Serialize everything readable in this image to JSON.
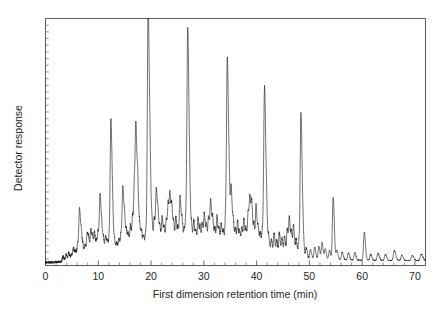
{
  "figure": {
    "background_color": "#ffffff",
    "trace_color": "#1a1a1a",
    "axis_color": "#4a4a4a"
  },
  "chart_data": {
    "type": "line",
    "title": "",
    "subtitle": "",
    "xlabel": "First dimension retention time (min)",
    "ylabel": "Detector response",
    "xlim": [
      0,
      72
    ],
    "ylim": [
      0,
      100
    ],
    "xticks": [
      0,
      10,
      20,
      30,
      40,
      50,
      60,
      70
    ],
    "xtick_labels": [
      "0",
      "10",
      "20",
      "30",
      "40",
      "50",
      "60",
      "70"
    ],
    "yticks": [],
    "ytick_labels": [],
    "y_minor_tick_count": 37,
    "x_minor_tick_step": 2,
    "grid": false,
    "legend": false,
    "legend_position": "none",
    "annotations": [],
    "series": [
      {
        "name": "GC x GC first dimension chromatogram",
        "baseline": 2.0,
        "baseline_drift": [
          {
            "x": 0,
            "y": 1.2
          },
          {
            "x": 3,
            "y": 1.5
          },
          {
            "x": 8,
            "y": 3.2
          },
          {
            "x": 14,
            "y": 4.6
          },
          {
            "x": 20,
            "y": 5.4
          },
          {
            "x": 28,
            "y": 5.6
          },
          {
            "x": 36,
            "y": 5.2
          },
          {
            "x": 44,
            "y": 4.2
          },
          {
            "x": 50,
            "y": 3.0
          },
          {
            "x": 58,
            "y": 2.2
          },
          {
            "x": 66,
            "y": 2.0
          },
          {
            "x": 72,
            "y": 2.1
          }
        ],
        "peaks": [
          {
            "x": 3.3,
            "h": 2.0,
            "w": 0.14
          },
          {
            "x": 3.9,
            "h": 2.6,
            "w": 0.12
          },
          {
            "x": 4.4,
            "h": 3.2,
            "w": 0.12
          },
          {
            "x": 4.9,
            "h": 2.4,
            "w": 0.12
          },
          {
            "x": 5.3,
            "h": 4.5,
            "w": 0.13
          },
          {
            "x": 5.7,
            "h": 3.0,
            "w": 0.12
          },
          {
            "x": 6.1,
            "h": 6.0,
            "w": 0.12
          },
          {
            "x": 6.45,
            "h": 19.5,
            "w": 0.13
          },
          {
            "x": 6.8,
            "h": 7.5,
            "w": 0.12
          },
          {
            "x": 7.1,
            "h": 4.0,
            "w": 0.12
          },
          {
            "x": 7.5,
            "h": 5.2,
            "w": 0.12
          },
          {
            "x": 7.9,
            "h": 9.5,
            "w": 0.12
          },
          {
            "x": 8.2,
            "h": 6.0,
            "w": 0.12
          },
          {
            "x": 8.6,
            "h": 11.0,
            "w": 0.12
          },
          {
            "x": 8.95,
            "h": 7.0,
            "w": 0.12
          },
          {
            "x": 9.3,
            "h": 9.0,
            "w": 0.12
          },
          {
            "x": 9.7,
            "h": 6.0,
            "w": 0.12
          },
          {
            "x": 10.0,
            "h": 8.5,
            "w": 0.12
          },
          {
            "x": 10.35,
            "h": 24.0,
            "w": 0.13
          },
          {
            "x": 10.7,
            "h": 8.0,
            "w": 0.12
          },
          {
            "x": 11.0,
            "h": 5.5,
            "w": 0.12
          },
          {
            "x": 11.4,
            "h": 7.5,
            "w": 0.12
          },
          {
            "x": 11.75,
            "h": 5.0,
            "w": 0.12
          },
          {
            "x": 12.1,
            "h": 6.5,
            "w": 0.12
          },
          {
            "x": 12.4,
            "h": 53.0,
            "w": 0.14
          },
          {
            "x": 12.75,
            "h": 9.0,
            "w": 0.12
          },
          {
            "x": 13.1,
            "h": 5.0,
            "w": 0.12
          },
          {
            "x": 13.5,
            "h": 4.5,
            "w": 0.12
          },
          {
            "x": 13.9,
            "h": 6.0,
            "w": 0.12
          },
          {
            "x": 14.3,
            "h": 8.0,
            "w": 0.12
          },
          {
            "x": 14.65,
            "h": 26.0,
            "w": 0.13
          },
          {
            "x": 15.0,
            "h": 11.5,
            "w": 0.12
          },
          {
            "x": 15.35,
            "h": 8.0,
            "w": 0.12
          },
          {
            "x": 15.7,
            "h": 7.0,
            "w": 0.12
          },
          {
            "x": 16.1,
            "h": 11.0,
            "w": 0.12
          },
          {
            "x": 16.5,
            "h": 14.0,
            "w": 0.12
          },
          {
            "x": 16.85,
            "h": 25.0,
            "w": 0.13
          },
          {
            "x": 17.15,
            "h": 44.5,
            "w": 0.14
          },
          {
            "x": 17.5,
            "h": 20.0,
            "w": 0.12
          },
          {
            "x": 17.85,
            "h": 9.0,
            "w": 0.12
          },
          {
            "x": 18.2,
            "h": 8.0,
            "w": 0.12
          },
          {
            "x": 18.6,
            "h": 6.5,
            "w": 0.12
          },
          {
            "x": 19.0,
            "h": 7.5,
            "w": 0.12
          },
          {
            "x": 19.45,
            "h": 99.8,
            "w": 0.15
          },
          {
            "x": 19.85,
            "h": 22.0,
            "w": 0.12
          },
          {
            "x": 20.2,
            "h": 10.0,
            "w": 0.12
          },
          {
            "x": 20.6,
            "h": 13.0,
            "w": 0.12
          },
          {
            "x": 21.0,
            "h": 24.5,
            "w": 0.13
          },
          {
            "x": 21.35,
            "h": 12.0,
            "w": 0.12
          },
          {
            "x": 21.7,
            "h": 9.0,
            "w": 0.12
          },
          {
            "x": 22.1,
            "h": 14.0,
            "w": 0.12
          },
          {
            "x": 22.5,
            "h": 9.5,
            "w": 0.12
          },
          {
            "x": 22.9,
            "h": 12.5,
            "w": 0.12
          },
          {
            "x": 23.25,
            "h": 18.0,
            "w": 0.12
          },
          {
            "x": 23.6,
            "h": 21.0,
            "w": 0.13
          },
          {
            "x": 23.95,
            "h": 15.0,
            "w": 0.12
          },
          {
            "x": 24.3,
            "h": 10.0,
            "w": 0.12
          },
          {
            "x": 24.7,
            "h": 13.5,
            "w": 0.12
          },
          {
            "x": 25.1,
            "h": 9.0,
            "w": 0.12
          },
          {
            "x": 25.5,
            "h": 22.0,
            "w": 0.13
          },
          {
            "x": 25.9,
            "h": 11.0,
            "w": 0.12
          },
          {
            "x": 26.3,
            "h": 8.5,
            "w": 0.12
          },
          {
            "x": 26.6,
            "h": 10.0,
            "w": 0.12
          },
          {
            "x": 26.95,
            "h": 89.0,
            "w": 0.15
          },
          {
            "x": 27.35,
            "h": 14.0,
            "w": 0.12
          },
          {
            "x": 27.7,
            "h": 9.0,
            "w": 0.12
          },
          {
            "x": 28.1,
            "h": 12.0,
            "w": 0.12
          },
          {
            "x": 28.5,
            "h": 8.0,
            "w": 0.12
          },
          {
            "x": 28.9,
            "h": 13.0,
            "w": 0.12
          },
          {
            "x": 29.3,
            "h": 9.5,
            "w": 0.12
          },
          {
            "x": 29.7,
            "h": 11.0,
            "w": 0.12
          },
          {
            "x": 30.1,
            "h": 15.0,
            "w": 0.12
          },
          {
            "x": 30.5,
            "h": 10.0,
            "w": 0.12
          },
          {
            "x": 30.9,
            "h": 13.5,
            "w": 0.12
          },
          {
            "x": 31.3,
            "h": 20.0,
            "w": 0.13
          },
          {
            "x": 31.7,
            "h": 12.0,
            "w": 0.12
          },
          {
            "x": 32.1,
            "h": 9.0,
            "w": 0.12
          },
          {
            "x": 32.5,
            "h": 14.0,
            "w": 0.12
          },
          {
            "x": 32.9,
            "h": 8.5,
            "w": 0.12
          },
          {
            "x": 33.3,
            "h": 11.0,
            "w": 0.12
          },
          {
            "x": 33.7,
            "h": 8.0,
            "w": 0.12
          },
          {
            "x": 34.1,
            "h": 12.0,
            "w": 0.12
          },
          {
            "x": 34.45,
            "h": 77.0,
            "w": 0.15
          },
          {
            "x": 34.85,
            "h": 16.0,
            "w": 0.12
          },
          {
            "x": 35.2,
            "h": 24.0,
            "w": 0.13
          },
          {
            "x": 35.6,
            "h": 11.0,
            "w": 0.12
          },
          {
            "x": 36.0,
            "h": 9.0,
            "w": 0.12
          },
          {
            "x": 36.4,
            "h": 12.0,
            "w": 0.12
          },
          {
            "x": 36.8,
            "h": 8.0,
            "w": 0.12
          },
          {
            "x": 37.2,
            "h": 10.0,
            "w": 0.12
          },
          {
            "x": 37.6,
            "h": 13.0,
            "w": 0.12
          },
          {
            "x": 38.0,
            "h": 9.5,
            "w": 0.12
          },
          {
            "x": 38.4,
            "h": 16.0,
            "w": 0.12
          },
          {
            "x": 38.75,
            "h": 21.0,
            "w": 0.13
          },
          {
            "x": 39.1,
            "h": 17.0,
            "w": 0.12
          },
          {
            "x": 39.5,
            "h": 11.0,
            "w": 0.12
          },
          {
            "x": 39.9,
            "h": 19.0,
            "w": 0.12
          },
          {
            "x": 40.3,
            "h": 10.0,
            "w": 0.12
          },
          {
            "x": 40.7,
            "h": 8.0,
            "w": 0.12
          },
          {
            "x": 41.1,
            "h": 9.0,
            "w": 0.12
          },
          {
            "x": 41.5,
            "h": 67.0,
            "w": 0.15
          },
          {
            "x": 41.9,
            "h": 12.0,
            "w": 0.12
          },
          {
            "x": 42.3,
            "h": 7.0,
            "w": 0.12
          },
          {
            "x": 42.8,
            "h": 6.0,
            "w": 0.12
          },
          {
            "x": 43.3,
            "h": 8.5,
            "w": 0.12
          },
          {
            "x": 43.8,
            "h": 6.0,
            "w": 0.12
          },
          {
            "x": 44.3,
            "h": 9.0,
            "w": 0.12
          },
          {
            "x": 44.8,
            "h": 7.0,
            "w": 0.12
          },
          {
            "x": 45.3,
            "h": 8.0,
            "w": 0.12
          },
          {
            "x": 45.8,
            "h": 11.0,
            "w": 0.12
          },
          {
            "x": 46.2,
            "h": 15.0,
            "w": 0.12
          },
          {
            "x": 46.6,
            "h": 9.0,
            "w": 0.12
          },
          {
            "x": 47.0,
            "h": 12.0,
            "w": 0.12
          },
          {
            "x": 47.5,
            "h": 7.0,
            "w": 0.12
          },
          {
            "x": 48.0,
            "h": 6.0,
            "w": 0.12
          },
          {
            "x": 48.4,
            "h": 58.0,
            "w": 0.14
          },
          {
            "x": 48.8,
            "h": 8.0,
            "w": 0.12
          },
          {
            "x": 49.4,
            "h": 4.0,
            "w": 0.12
          },
          {
            "x": 50.2,
            "h": 3.5,
            "w": 0.13
          },
          {
            "x": 51.0,
            "h": 4.5,
            "w": 0.13
          },
          {
            "x": 51.8,
            "h": 5.0,
            "w": 0.13
          },
          {
            "x": 52.4,
            "h": 6.5,
            "w": 0.13
          },
          {
            "x": 53.0,
            "h": 4.0,
            "w": 0.13
          },
          {
            "x": 53.8,
            "h": 3.5,
            "w": 0.13
          },
          {
            "x": 54.5,
            "h": 25.0,
            "w": 0.14
          },
          {
            "x": 55.2,
            "h": 3.5,
            "w": 0.13
          },
          {
            "x": 56.2,
            "h": 3.0,
            "w": 0.14
          },
          {
            "x": 57.4,
            "h": 2.8,
            "w": 0.14
          },
          {
            "x": 58.6,
            "h": 3.0,
            "w": 0.14
          },
          {
            "x": 60.4,
            "h": 11.5,
            "w": 0.14
          },
          {
            "x": 61.6,
            "h": 2.5,
            "w": 0.14
          },
          {
            "x": 63.0,
            "h": 3.0,
            "w": 0.16
          },
          {
            "x": 64.4,
            "h": 2.5,
            "w": 0.16
          },
          {
            "x": 66.1,
            "h": 4.0,
            "w": 0.18
          },
          {
            "x": 67.5,
            "h": 2.2,
            "w": 0.16
          },
          {
            "x": 69.5,
            "h": 2.0,
            "w": 0.18
          },
          {
            "x": 71.2,
            "h": 2.5,
            "w": 0.18
          }
        ],
        "noise_amplitude": 1.1
      }
    ]
  }
}
